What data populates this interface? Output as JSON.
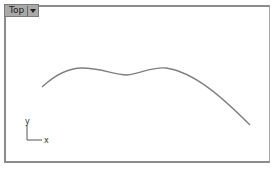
{
  "viewport": {
    "name": "Top",
    "menu_icon": "dropdown-arrow-icon"
  },
  "axes": {
    "x_label": "x",
    "y_label": "y"
  },
  "curve": {
    "color": "#7f7f7f"
  }
}
